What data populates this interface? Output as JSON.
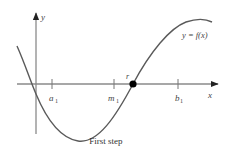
{
  "diagram": {
    "title": "First step",
    "axis_x_label": "x",
    "axis_y_label": "y",
    "curve_label": "y = f(x)",
    "points": {
      "a1": {
        "label": "a",
        "sub": "1"
      },
      "m1": {
        "label": "m",
        "sub": "1"
      },
      "b1": {
        "label": "b",
        "sub": "1"
      },
      "r": {
        "label": "r"
      }
    },
    "colors": {
      "axis": "#8a8a8a",
      "curve": "#5a5a5a",
      "root_dot": "#000000",
      "text": "#444444"
    }
  }
}
